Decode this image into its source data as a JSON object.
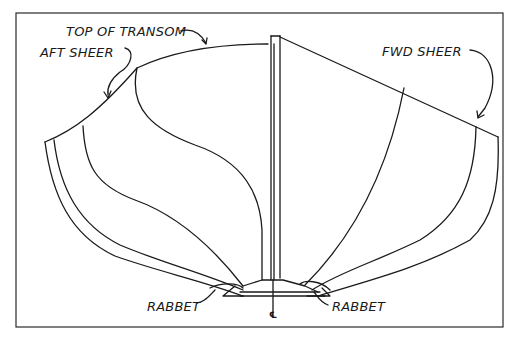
{
  "diagram": {
    "type": "hull body plan (line drawing)",
    "labels": {
      "top_of_transom": "TOP OF TRANSOM",
      "aft_sheer": "AFT SHEER",
      "fwd_sheer": "FWD SHEER",
      "rabbet_left": "RABBET",
      "rabbet_right": "RABBET",
      "centerline": "℄"
    },
    "colors": {
      "ink": "#1a1a1a",
      "background": "#ffffff",
      "frame": "#2a2a2a"
    }
  }
}
